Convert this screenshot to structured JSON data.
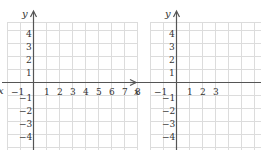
{
  "graphs": [
    {
      "id": "left",
      "x_axis_label": "x",
      "y_axis_label": "y",
      "x_ticks": [
        "−1",
        "1",
        "2",
        "3",
        "4",
        "5",
        "6",
        "7",
        "8",
        "9"
      ],
      "y_ticks_pos": [
        "4",
        "3",
        "2",
        "1"
      ],
      "y_ticks_neg": [
        "−1",
        "−2",
        "−3",
        "−4"
      ]
    },
    {
      "id": "right",
      "x_axis_label": "x",
      "y_axis_label": "y",
      "x_ticks": [
        "−1",
        "1",
        "2",
        "3"
      ],
      "y_ticks_pos": [
        "4",
        "3",
        "2",
        "1"
      ],
      "y_ticks_neg": [
        "−1",
        "−2",
        "−3",
        "−4"
      ]
    }
  ],
  "colors": {
    "grid": "#dcdcdc",
    "axis": "#555555",
    "text": "#333333"
  }
}
